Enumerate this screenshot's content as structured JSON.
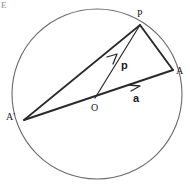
{
  "figure": {
    "width": 189,
    "height": 186,
    "background": "#ffffff",
    "stroke_color": "#2a2a2a",
    "circle_stroke_color": "#6a6a6a",
    "corner_mark": "E"
  },
  "labels": {
    "point_P": "P",
    "point_A": "A",
    "point_A_prime": "A'",
    "point_O": "O",
    "vector_p": "p",
    "vector_a": "a"
  },
  "geometry": {
    "circle": {
      "cx": 97,
      "cy": 94,
      "r": 85
    },
    "points": {
      "P": {
        "x": 140,
        "y": 25
      },
      "A": {
        "x": 173,
        "y": 70
      },
      "A_prime": {
        "x": 24,
        "y": 120
      },
      "O": {
        "x": 95,
        "y": 98
      }
    },
    "segments": [
      {
        "name": "diameter-Aprime-A",
        "from": "A_prime",
        "to": "A"
      },
      {
        "name": "chord-Aprime-P",
        "from": "A_prime",
        "to": "P"
      },
      {
        "name": "chord-P-A",
        "from": "P",
        "to": "A"
      }
    ],
    "vectors": [
      {
        "name": "vector-p",
        "from": "O",
        "to": "P",
        "label": "p"
      },
      {
        "name": "vector-a",
        "from": "O",
        "to": "A",
        "label": "a"
      }
    ]
  }
}
